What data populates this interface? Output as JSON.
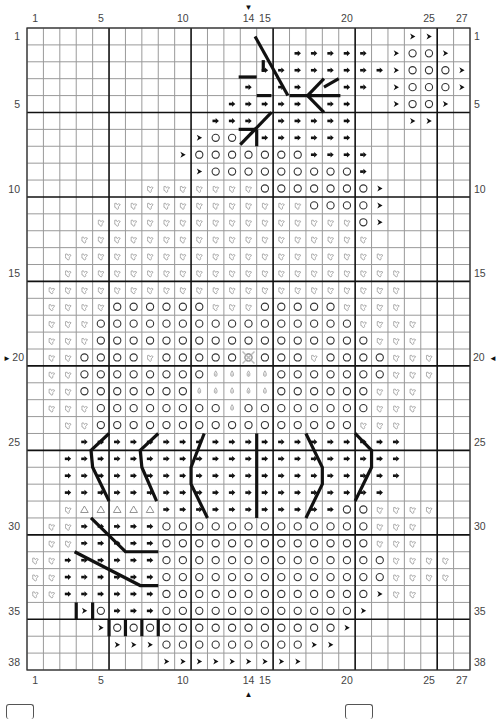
{
  "chart": {
    "title": "",
    "columns": 27,
    "rows": 38,
    "col_labels": [
      {
        "col": 1,
        "text": "1"
      },
      {
        "col": 5,
        "text": "5"
      },
      {
        "col": 10,
        "text": "10"
      },
      {
        "col": 14,
        "text": "14"
      },
      {
        "col": 15,
        "text": "15"
      },
      {
        "col": 20,
        "text": "20"
      },
      {
        "col": 25,
        "text": "25"
      },
      {
        "col": 27,
        "text": "27"
      }
    ],
    "row_labels": [
      {
        "row": 1,
        "text": "1"
      },
      {
        "row": 5,
        "text": "5"
      },
      {
        "row": 10,
        "text": "10"
      },
      {
        "row": 15,
        "text": "15"
      },
      {
        "row": 20,
        "text": "20"
      },
      {
        "row": 25,
        "text": "25"
      },
      {
        "row": 30,
        "text": "30"
      },
      {
        "row": 35,
        "text": "35"
      },
      {
        "row": 38,
        "text": "38"
      }
    ],
    "center_markers": {
      "top": {
        "col": 14,
        "glyph": "▼"
      },
      "bottom": {
        "col": 14,
        "glyph": "▲"
      },
      "left": {
        "row": 20,
        "glyph": "►"
      },
      "right": {
        "row": 20,
        "glyph": "◄"
      }
    },
    "thick_line_every": 5,
    "symbol_key": {
      ".": "empty",
      "a": "arrow-dot",
      ">": "chevron",
      "o": "circle",
      "l": "leaf",
      "d": "drop",
      "t": "triangle",
      "x": "center-circle"
    },
    "colors": {
      "grid_thin": "#9a9a9a",
      "grid_thick": "#111111",
      "symbol_dark": "#111111",
      "symbol_light": "#9a9a9a",
      "backstitch": "#111111"
    },
    "grid": [
      ".......................>>..",
      "................aaaaa.>oo>.",
      "..............aaaaaaaa>ooo>",
      ".............a.aa..aa.>ooo>",
      "............aaaaa.aa..>oo>.",
      "...........aaa.aaaaa...>>..",
      "..........>oo.aaaaaa.......",
      ".........>oooooooaaaa......",
      "..........>oooooooooa......",
      ".......lllllllooooooo>.....",
      ".....lllllllllllloooo>.....",
      "....llllllllllllllllo>......",
      "...llllllllllllllllll......",
      "..llllllllllllllllllll.....",
      "..lllllllllllllllllllll....",
      ".llllllllllllllllllllll....",
      ".lllloooooolllooooollll....",
      ".llloooooooooooooooollll...",
      ".lllooooooooooooooooolll...",
      ".llooooloooooxoooloooolll...",
      ".llooooooooddddooooooolll...",
      ".llooooooodddddoooooolll...",
      ".llloooooooodoooooooolll....",
      "..lloooooooooooooooolll....",
      "...aaaaaaaaaaaaaaaaaaaa....",
      "..aaaaaaaaaaaaaaaaaaaaa....",
      "..aaaaaaaaaaaaaaaaaaaaa....",
      "..aaaaaaaaaaaaaaaaaaaa.....",
      "..ltttttaaaaaaaaaaaoollll....",
      ".llaaaaaooooooooooooolll...",
      ".llaaaaaooooooooooooolll...",
      "llaaaaaaoooooooooooooollll..",
      "llaaaaaaoooooooooooooollll..",
      "llaaaaaaooooooooooooo>ll...",
      "...>oaaaoooooooooooo>......",
      "....>oooooooooooooo>.......",
      ".....>>>ooooooooo>>........",
      "........>>>>>>>>>.........."
    ],
    "backstitch_lines": [
      {
        "points": [
          [
            13.9,
            0.5
          ],
          [
            15.9,
            4
          ]
        ]
      },
      {
        "points": [
          [
            14.4,
            1.9
          ],
          [
            14.4,
            2.6
          ]
        ]
      },
      {
        "points": [
          [
            12.9,
            2.9
          ],
          [
            14.0,
            2.9
          ]
        ]
      },
      {
        "points": [
          [
            14.0,
            4.0
          ],
          [
            14.9,
            4.0
          ]
        ]
      },
      {
        "points": [
          [
            16.0,
            4.0
          ],
          [
            19.1,
            4.0
          ]
        ]
      },
      {
        "points": [
          [
            17.1,
            4.0
          ],
          [
            18.1,
            3.0
          ]
        ]
      },
      {
        "points": [
          [
            18.1,
            3.5
          ],
          [
            19.0,
            3.0
          ]
        ]
      },
      {
        "points": [
          [
            17.1,
            4.0
          ],
          [
            18.1,
            5.0
          ]
        ]
      },
      {
        "points": [
          [
            14.9,
            5.0
          ],
          [
            13.0,
            6.9
          ]
        ]
      },
      {
        "points": [
          [
            12.9,
            6.0
          ],
          [
            14.0,
            6.0
          ]
        ]
      },
      {
        "points": [
          [
            14.0,
            6.0
          ],
          [
            14.0,
            7.0
          ]
        ]
      },
      {
        "points": [
          [
            5.0,
            24.0
          ],
          [
            3.9,
            25.0
          ],
          [
            4.0,
            26.0
          ],
          [
            5.0,
            28.0
          ]
        ]
      },
      {
        "points": [
          [
            8.0,
            24.0
          ],
          [
            6.9,
            25.0
          ],
          [
            7.0,
            26.0
          ],
          [
            7.9,
            28.0
          ]
        ]
      },
      {
        "points": [
          [
            10.8,
            24.0
          ],
          [
            10.0,
            26.0
          ],
          [
            10.0,
            27.0
          ],
          [
            11.0,
            29.0
          ]
        ]
      },
      {
        "points": [
          [
            14.0,
            24.0
          ],
          [
            14.0,
            29.0
          ]
        ]
      },
      {
        "points": [
          [
            17.0,
            24.0
          ],
          [
            18.0,
            26.0
          ],
          [
            18.0,
            27.0
          ],
          [
            17.0,
            29.0
          ]
        ]
      },
      {
        "points": [
          [
            20.0,
            24.0
          ],
          [
            21.0,
            25.0
          ],
          [
            21.0,
            26.0
          ],
          [
            20.0,
            28.0
          ]
        ]
      },
      {
        "points": [
          [
            3.9,
            29.0
          ],
          [
            6.0,
            31.0
          ],
          [
            8.0,
            31.0
          ]
        ]
      },
      {
        "points": [
          [
            2.9,
            31.0
          ],
          [
            6.9,
            33.0
          ],
          [
            8.0,
            33.0
          ]
        ]
      },
      {
        "points": [
          [
            3.0,
            34.0
          ],
          [
            3.0,
            35.0
          ]
        ]
      },
      {
        "points": [
          [
            4.0,
            34.0
          ],
          [
            4.0,
            35.0
          ]
        ]
      },
      {
        "points": [
          [
            5.0,
            35.0
          ],
          [
            5.0,
            36.0
          ]
        ]
      },
      {
        "points": [
          [
            6.0,
            35.0
          ],
          [
            6.0,
            36.0
          ]
        ]
      },
      {
        "points": [
          [
            7.0,
            35.0
          ],
          [
            7.0,
            36.0
          ]
        ]
      },
      {
        "points": [
          [
            8.0,
            35.0
          ],
          [
            8.0,
            36.0
          ]
        ]
      }
    ]
  },
  "legend": {
    "boxes": [
      {
        "position": "left"
      },
      {
        "position": "right"
      }
    ]
  }
}
